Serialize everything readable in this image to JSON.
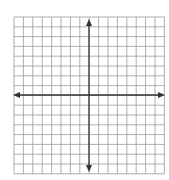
{
  "diagram": {
    "type": "coordinate-plane",
    "grid": {
      "columns": 16,
      "rows": 16,
      "left": 14,
      "top": 17,
      "cell_width": 9.4,
      "cell_height": 9.8,
      "line_color": "#9a9a9a",
      "background": "#ffffff"
    },
    "axes": {
      "x_axis_y": 95,
      "y_axis_x": 89,
      "x_extent": [
        13,
        165
      ],
      "y_extent": [
        19,
        172
      ],
      "color": "#333333",
      "arrowheads": [
        "up",
        "down",
        "left",
        "right"
      ]
    }
  }
}
